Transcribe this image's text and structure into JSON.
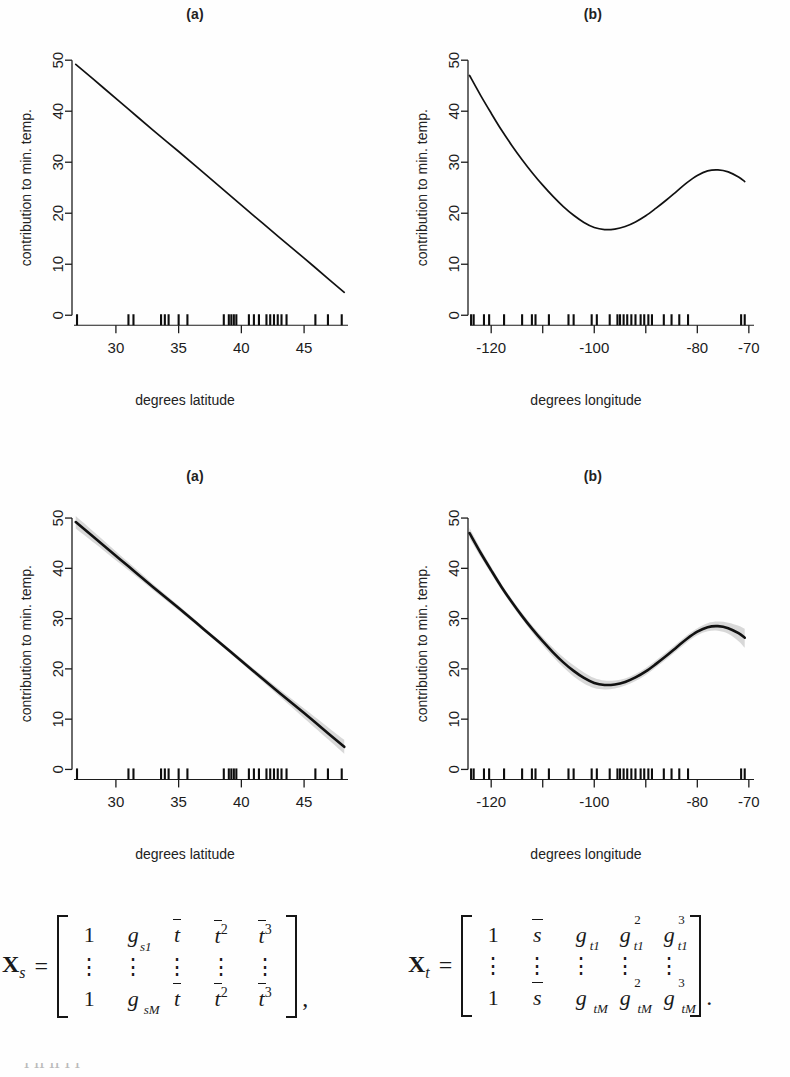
{
  "figure": {
    "panel_labels": {
      "a": "(a)",
      "b": "(b)"
    },
    "ylabel": "contribution to min. temp.",
    "xlabel_latitude": "degrees latitude",
    "xlabel_longitude": "degrees longitude",
    "band_color": "#c9c9c9",
    "line_color": "#111111"
  },
  "chart_data": [
    {
      "id": "row1-a",
      "type": "line",
      "title": "(a)",
      "xlabel": "degrees latitude",
      "ylabel": "contribution to min. temp.",
      "xlim": [
        26.5,
        48.5
      ],
      "ylim": [
        -2.5,
        52
      ],
      "xticks": [
        30,
        35,
        40,
        45
      ],
      "xticklabels": [
        "30",
        "35",
        "40",
        "45"
      ],
      "yticks": [
        0,
        10,
        20,
        30,
        40,
        50
      ],
      "yticklabels": [
        "0",
        "10",
        "20",
        "30",
        "40",
        "50"
      ],
      "grid": false,
      "legend": "none",
      "series": [
        {
          "name": "fitted latitude effect",
          "x": [
            26.8,
            29.0,
            31.0,
            33.0,
            35.0,
            37.0,
            39.0,
            41.0,
            43.0,
            45.0,
            47.0,
            48.2
          ],
          "values": [
            49.2,
            44.6,
            40.4,
            36.2,
            32.1,
            27.9,
            23.7,
            19.5,
            15.3,
            11.2,
            7.0,
            4.5
          ]
        }
      ],
      "rug": [
        26.9,
        31.0,
        31.4,
        33.6,
        33.9,
        34.2,
        35.0,
        35.7,
        38.6,
        39.0,
        39.2,
        39.4,
        39.6,
        40.6,
        41.0,
        41.4,
        42.0,
        42.3,
        42.6,
        42.9,
        43.2,
        43.6,
        45.9,
        46.9,
        48.0
      ],
      "band": null
    },
    {
      "id": "row1-b",
      "type": "line",
      "title": "(b)",
      "xlabel": "degrees longitude",
      "ylabel": "contribution to min. temp.",
      "xlim": [
        -124.5,
        -69.0
      ],
      "ylim": [
        -2.5,
        52
      ],
      "xticks": [
        -120,
        -110,
        -100,
        -90,
        -80,
        -70
      ],
      "xticklabels": [
        "-120",
        "",
        "-100",
        "",
        "-80",
        "-70"
      ],
      "yticks": [
        0,
        10,
        20,
        30,
        40,
        50
      ],
      "yticklabels": [
        "0",
        "10",
        "20",
        "30",
        "40",
        "50"
      ],
      "grid": false,
      "legend": "none",
      "series": [
        {
          "name": "fitted longitude effect",
          "x": [
            -124.2,
            -122.0,
            -120.0,
            -118.0,
            -116.0,
            -114.0,
            -112.0,
            -110.0,
            -108.0,
            -106.0,
            -104.0,
            -102.0,
            -100.0,
            -98.0,
            -96.0,
            -94.0,
            -92.0,
            -90.0,
            -88.0,
            -86.0,
            -84.0,
            -82.0,
            -80.0,
            -78.0,
            -76.0,
            -74.0,
            -72.0,
            -70.8
          ],
          "values": [
            47.0,
            43.0,
            39.6,
            36.3,
            33.3,
            30.5,
            27.9,
            25.5,
            23.3,
            21.3,
            19.6,
            18.2,
            17.2,
            16.8,
            16.9,
            17.4,
            18.3,
            19.5,
            21.0,
            22.6,
            24.3,
            26.0,
            27.4,
            28.3,
            28.5,
            28.1,
            27.1,
            26.2
          ]
        }
      ],
      "rug": [
        -123.9,
        -123.4,
        -121.4,
        -120.4,
        -117.5,
        -114.0,
        -112.1,
        -111.4,
        -108.8,
        -105.0,
        -104.0,
        -100.5,
        -99.5,
        -97.0,
        -95.5,
        -95.0,
        -94.3,
        -93.6,
        -92.8,
        -92.0,
        -91.0,
        -90.3,
        -89.5,
        -88.8,
        -86.5,
        -85.0,
        -83.5,
        -81.8,
        -71.5,
        -70.8
      ],
      "band": null
    },
    {
      "id": "row2-a",
      "type": "line",
      "title": "(a)",
      "xlabel": "degrees latitude",
      "ylabel": "contribution to min. temp.",
      "xlim": [
        26.5,
        48.5
      ],
      "ylim": [
        -2.5,
        52
      ],
      "xticks": [
        30,
        35,
        40,
        45
      ],
      "xticklabels": [
        "30",
        "35",
        "40",
        "45"
      ],
      "yticks": [
        0,
        10,
        20,
        30,
        40,
        50
      ],
      "yticklabels": [
        "0",
        "10",
        "20",
        "30",
        "40",
        "50"
      ],
      "grid": false,
      "legend": "none",
      "series": [
        {
          "name": "fitted latitude effect",
          "x": [
            26.8,
            29.0,
            31.0,
            33.0,
            35.0,
            37.0,
            39.0,
            41.0,
            43.0,
            45.0,
            47.0,
            48.2
          ],
          "values": [
            49.2,
            44.6,
            40.4,
            36.2,
            32.1,
            27.9,
            23.7,
            19.5,
            15.3,
            11.2,
            7.0,
            4.5
          ]
        }
      ],
      "band": {
        "name": "bootstrap confidence band",
        "x": [
          26.8,
          29.0,
          31.0,
          33.0,
          35.0,
          37.0,
          39.0,
          41.0,
          43.0,
          45.0,
          47.0,
          48.2
        ],
        "lower": [
          47.9,
          43.6,
          39.6,
          35.6,
          31.6,
          27.5,
          23.3,
          19.0,
          14.6,
          10.2,
          5.8,
          3.1
        ],
        "upper": [
          50.4,
          45.6,
          41.2,
          36.8,
          32.6,
          28.3,
          24.1,
          20.0,
          16.0,
          12.1,
          8.2,
          5.9
        ]
      },
      "rug": [
        26.9,
        31.0,
        31.4,
        33.6,
        33.9,
        34.2,
        35.0,
        35.7,
        38.6,
        39.0,
        39.2,
        39.4,
        39.6,
        40.6,
        41.0,
        41.4,
        42.0,
        42.3,
        42.6,
        42.9,
        43.2,
        43.6,
        45.9,
        46.9,
        48.0
      ]
    },
    {
      "id": "row2-b",
      "type": "line",
      "title": "(b)",
      "xlabel": "degrees longitude",
      "ylabel": "contribution to min. temp.",
      "xlim": [
        -124.5,
        -69.0
      ],
      "ylim": [
        -2.5,
        52
      ],
      "xticks": [
        -120,
        -110,
        -100,
        -90,
        -80,
        -70
      ],
      "xticklabels": [
        "-120",
        "",
        "-100",
        "",
        "-80",
        "-70"
      ],
      "yticks": [
        0,
        10,
        20,
        30,
        40,
        50
      ],
      "yticklabels": [
        "0",
        "10",
        "20",
        "30",
        "40",
        "50"
      ],
      "grid": false,
      "legend": "none",
      "series": [
        {
          "name": "fitted longitude effect",
          "x": [
            -124.2,
            -122.0,
            -120.0,
            -118.0,
            -116.0,
            -114.0,
            -112.0,
            -110.0,
            -108.0,
            -106.0,
            -104.0,
            -102.0,
            -100.0,
            -98.0,
            -96.0,
            -94.0,
            -92.0,
            -90.0,
            -88.0,
            -86.0,
            -84.0,
            -82.0,
            -80.0,
            -78.0,
            -76.0,
            -74.0,
            -72.0,
            -70.8
          ],
          "values": [
            47.0,
            43.0,
            39.6,
            36.3,
            33.3,
            30.5,
            27.9,
            25.5,
            23.3,
            21.3,
            19.6,
            18.2,
            17.2,
            16.8,
            16.9,
            17.4,
            18.3,
            19.5,
            21.0,
            22.6,
            24.3,
            26.0,
            27.4,
            28.3,
            28.5,
            28.1,
            27.1,
            26.2
          ]
        }
      ],
      "band": {
        "name": "bootstrap confidence band",
        "x": [
          -124.2,
          -122.0,
          -120.0,
          -118.0,
          -116.0,
          -114.0,
          -112.0,
          -110.0,
          -108.0,
          -106.0,
          -104.0,
          -102.0,
          -100.0,
          -98.0,
          -96.0,
          -94.0,
          -92.0,
          -90.0,
          -88.0,
          -86.0,
          -84.0,
          -82.0,
          -80.0,
          -78.0,
          -76.0,
          -74.0,
          -72.0,
          -70.8
        ],
        "lower": [
          46.0,
          42.2,
          38.9,
          35.7,
          32.7,
          29.9,
          27.2,
          24.7,
          22.4,
          20.3,
          18.5,
          17.1,
          16.2,
          15.9,
          16.1,
          16.7,
          17.6,
          18.8,
          20.3,
          21.9,
          23.6,
          25.3,
          26.7,
          27.5,
          27.6,
          27.0,
          25.5,
          24.2
        ],
        "upper": [
          48.0,
          43.8,
          40.3,
          36.9,
          33.9,
          31.1,
          28.6,
          26.3,
          24.2,
          22.3,
          20.7,
          19.3,
          18.2,
          17.7,
          17.7,
          18.1,
          19.0,
          20.2,
          21.7,
          23.3,
          25.0,
          26.7,
          28.1,
          29.1,
          29.4,
          29.2,
          28.6,
          28.0
        ]
      },
      "rug": [
        -123.9,
        -123.4,
        -121.4,
        -120.4,
        -117.5,
        -114.0,
        -112.1,
        -111.4,
        -108.8,
        -105.0,
        -104.0,
        -100.5,
        -99.5,
        -97.0,
        -95.5,
        -95.0,
        -94.3,
        -93.6,
        -92.8,
        -92.0,
        -91.0,
        -90.3,
        -89.5,
        -88.8,
        -86.5,
        -85.0,
        -83.5,
        -81.8,
        -71.5,
        -70.8
      ]
    }
  ],
  "equations": {
    "left": {
      "lhs_symbol": "X",
      "lhs_sub": "s",
      "equals": "=",
      "rows": [
        [
          "1",
          "g",
          "t",
          "t",
          "t"
        ],
        [
          "⋮",
          "⋮",
          "⋮",
          "⋮",
          "⋮"
        ],
        [
          "1",
          "g",
          "t",
          "t",
          "t"
        ]
      ],
      "col1": [
        "1",
        "1"
      ],
      "col2_sub": [
        "s1",
        "sM"
      ],
      "col3": "t̄",
      "col4_sup": "2",
      "col5_sup": "3",
      "trailing": ","
    },
    "right": {
      "lhs_symbol": "X",
      "lhs_sub": "t",
      "equals": "=",
      "col1": [
        "1",
        "1"
      ],
      "col2": "s̄",
      "col3_sub": [
        "t1",
        "tM"
      ],
      "col4_sup": "2",
      "col5_sup": "3",
      "trailing": "."
    }
  },
  "bottom_cut_text": "i  li  li  l                          l"
}
